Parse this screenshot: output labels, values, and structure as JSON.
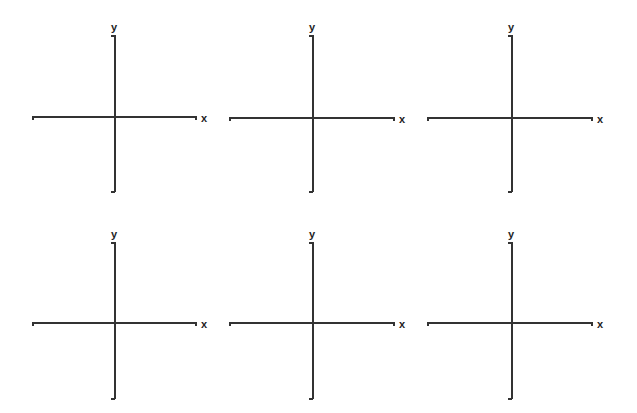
{
  "axes_labels": {
    "x": "x",
    "y": "y"
  },
  "colors": {
    "axis": "#333333",
    "label": "#222222",
    "background": "#ffffff"
  },
  "panels": [
    {
      "id": 1,
      "row": 0,
      "col": 0,
      "origin": [
        114,
        116
      ],
      "x_range": [
        32,
        196
      ],
      "y_range": [
        35,
        192
      ]
    },
    {
      "id": 2,
      "row": 0,
      "col": 1,
      "origin": [
        312,
        117
      ],
      "x_range": [
        229,
        394
      ],
      "y_range": [
        35,
        192
      ]
    },
    {
      "id": 3,
      "row": 0,
      "col": 2,
      "origin": [
        511,
        117
      ],
      "x_range": [
        427,
        592
      ],
      "y_range": [
        35,
        192
      ]
    },
    {
      "id": 4,
      "row": 1,
      "col": 0,
      "origin": [
        114,
        322
      ],
      "x_range": [
        32,
        196
      ],
      "y_range": [
        242,
        399
      ]
    },
    {
      "id": 5,
      "row": 1,
      "col": 1,
      "origin": [
        312,
        322
      ],
      "x_range": [
        229,
        394
      ],
      "y_range": [
        242,
        399
      ]
    },
    {
      "id": 6,
      "row": 1,
      "col": 2,
      "origin": [
        511,
        322
      ],
      "x_range": [
        427,
        592
      ],
      "y_range": [
        242,
        399
      ]
    }
  ]
}
